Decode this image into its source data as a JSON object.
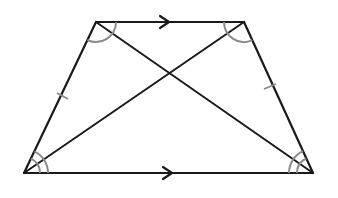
{
  "diagram": {
    "type": "isosceles-trapezoid",
    "vertices": {
      "top_left": [
        96,
        22
      ],
      "top_right": [
        244,
        22
      ],
      "bottom_right": [
        313,
        173
      ],
      "bottom_left": [
        24,
        173
      ]
    },
    "colors": {
      "lines": "#1a1a1a",
      "marks": "#8a8a8a",
      "background": "#ffffff"
    },
    "marks": {
      "parallel_arrows": [
        "top-base",
        "bottom-base"
      ],
      "congruent_ticks": [
        "left-leg",
        "right-leg"
      ],
      "single_arc_angles": [
        "top-left",
        "top-right"
      ],
      "double_arc_angles": [
        "bottom-left",
        "bottom-right"
      ]
    }
  }
}
